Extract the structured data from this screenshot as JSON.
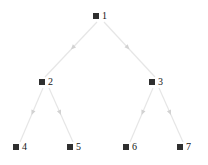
{
  "figure": {
    "kind": "binary-tree-diagram",
    "width": 208,
    "height": 165,
    "background_color": "#ffffff",
    "node_color": "#2f2f2f",
    "label_color": "#151515",
    "edge_color": "#e6e6e6",
    "arrow_color": "#d2d2d2"
  },
  "nodes": [
    {
      "id": "1",
      "label": "1",
      "x": 100,
      "y": 16,
      "level": 0
    },
    {
      "id": "2",
      "label": "2",
      "x": 46,
      "y": 82,
      "level": 1
    },
    {
      "id": "3",
      "label": "3",
      "x": 156,
      "y": 82,
      "level": 1
    },
    {
      "id": "4",
      "label": "4",
      "x": 20,
      "y": 147,
      "level": 2
    },
    {
      "id": "5",
      "label": "5",
      "x": 74,
      "y": 147,
      "level": 2
    },
    {
      "id": "6",
      "label": "6",
      "x": 130,
      "y": 147,
      "level": 2
    },
    {
      "id": "7",
      "label": "7",
      "x": 184,
      "y": 147,
      "level": 2
    }
  ],
  "edges": [
    {
      "id": "e1-2",
      "from": "1",
      "to": "2",
      "x1": 97,
      "y1": 22,
      "x2": 45,
      "y2": 77,
      "arrow_t": 0.5
    },
    {
      "id": "e1-3",
      "from": "1",
      "to": "3",
      "x1": 104,
      "y1": 22,
      "x2": 155,
      "y2": 77,
      "arrow_t": 0.5
    },
    {
      "id": "e2-4",
      "from": "2",
      "to": "4",
      "x1": 43,
      "y1": 88,
      "x2": 20,
      "y2": 142,
      "arrow_t": 0.5
    },
    {
      "id": "e2-5",
      "from": "2",
      "to": "5",
      "x1": 49,
      "y1": 88,
      "x2": 73,
      "y2": 142,
      "arrow_t": 0.5
    },
    {
      "id": "e3-6",
      "from": "3",
      "to": "6",
      "x1": 153,
      "y1": 88,
      "x2": 130,
      "y2": 142,
      "arrow_t": 0.5
    },
    {
      "id": "e3-7",
      "from": "3",
      "to": "7",
      "x1": 159,
      "y1": 88,
      "x2": 183,
      "y2": 142,
      "arrow_t": 0.5
    }
  ]
}
